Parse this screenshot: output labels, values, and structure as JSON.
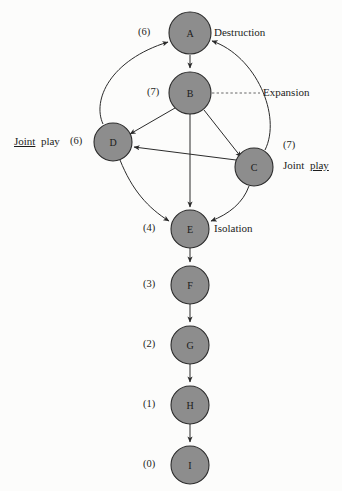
{
  "diagram": {
    "background_color": "#fcfcfb",
    "node_fill_color": "#8d8d8d",
    "node_stroke_color": "#2c2c2c",
    "edge_color": "#2b2b2b",
    "nodes": [
      {
        "id": "A",
        "label": "A",
        "cx": 190,
        "cy": 33,
        "r": 21,
        "rank": "(6)",
        "rank_x": 138,
        "rank_y": 26
      },
      {
        "id": "B",
        "label": "B",
        "cx": 190,
        "cy": 93,
        "r": 21,
        "rank": "(7)",
        "rank_x": 147,
        "rank_y": 86
      },
      {
        "id": "D",
        "label": "D",
        "cx": 113,
        "cy": 142,
        "r": 19,
        "rank": "(6)",
        "rank_x": 70,
        "rank_y": 135
      },
      {
        "id": "C",
        "label": "C",
        "cx": 254,
        "cy": 167,
        "r": 19,
        "rank": "(7)",
        "rank_x": 283,
        "rank_y": 139
      },
      {
        "id": "E",
        "label": "E",
        "cx": 190,
        "cy": 229,
        "r": 19,
        "rank": "(4)",
        "rank_x": 143,
        "rank_y": 222
      },
      {
        "id": "F",
        "label": "F",
        "cx": 190,
        "cy": 285,
        "r": 19,
        "rank": "(3)",
        "rank_x": 143,
        "rank_y": 278
      },
      {
        "id": "G",
        "label": "G",
        "cx": 190,
        "cy": 345,
        "r": 19,
        "rank": "(2)",
        "rank_x": 143,
        "rank_y": 338
      },
      {
        "id": "H",
        "label": "H",
        "cx": 190,
        "cy": 405,
        "r": 19,
        "rank": "(1)",
        "rank_x": 143,
        "rank_y": 398
      },
      {
        "id": "I",
        "label": "I",
        "cx": 190,
        "cy": 465,
        "r": 19,
        "rank": "(0)",
        "rank_x": 143,
        "rank_y": 458
      }
    ],
    "edges": [
      {
        "from": "A",
        "to": "B",
        "style": "straight"
      },
      {
        "from": "D",
        "to": "A",
        "style": "curved"
      },
      {
        "from": "C",
        "to": "A",
        "style": "curved"
      },
      {
        "from": "B",
        "to": "D",
        "style": "straight"
      },
      {
        "from": "B",
        "to": "C",
        "style": "straight"
      },
      {
        "from": "B",
        "to": "E",
        "style": "straight"
      },
      {
        "from": "C",
        "to": "D",
        "style": "straight"
      },
      {
        "from": "D",
        "to": "E",
        "style": "curved"
      },
      {
        "from": "C",
        "to": "E",
        "style": "curved"
      },
      {
        "from": "E",
        "to": "F",
        "style": "straight"
      },
      {
        "from": "F",
        "to": "G",
        "style": "straight"
      },
      {
        "from": "G",
        "to": "H",
        "style": "straight"
      },
      {
        "from": "H",
        "to": "I",
        "style": "straight"
      }
    ],
    "annotations": {
      "destruction": {
        "text": "Destruction",
        "x": 214,
        "y": 26
      },
      "expansion": {
        "text": "Expansion",
        "x": 263,
        "y": 86
      },
      "isolation": {
        "text": "Isolation",
        "x": 214,
        "y": 222
      },
      "joint_play_left": {
        "word1": "Joint",
        "word2": "play",
        "underlined": "word1",
        "x": 14,
        "y": 135
      },
      "joint_play_right": {
        "word1": "Joint",
        "word2": "play",
        "underlined": "word2",
        "x": 283,
        "y": 159
      }
    }
  }
}
